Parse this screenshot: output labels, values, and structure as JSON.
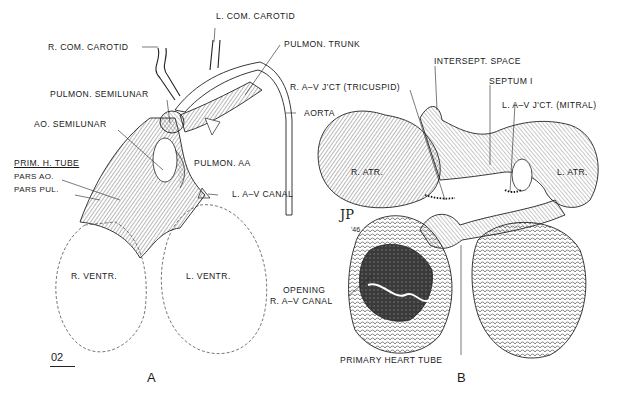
{
  "figure": {
    "panels": [
      {
        "id": "A",
        "letter": "A",
        "labels": {
          "r_com_carotid": "R. COM. CAROTID",
          "l_com_carotid": "L. COM. CAROTID",
          "pulmon_trunk": "PULMON. TRUNK",
          "pulmon_semilunar": "PULMON. SEMILUNAR",
          "ao_semilunar": "AO. SEMILUNAR",
          "prim_h_tube": "PRIM. H. TUBE",
          "pars_ao": "PARS AO.",
          "pars_pul": "PARS PUL.",
          "pulmon_aa": "PULMON. AA",
          "l_av_canal": "L. A–V CANAL",
          "aorta": "AORTA",
          "r_ventr": "R. VENTR.",
          "l_ventr": "L. VENTR."
        },
        "scale_label": "02"
      },
      {
        "id": "B",
        "letter": "B",
        "labels": {
          "r_av_jct": "R. A–V J'CT (TRICUSPID)",
          "intersept_space": "INTERSEPT. SPACE",
          "septum_i": "SEPTUM I",
          "l_av_jct": "L. A–V J'CT. (MITRAL)",
          "r_atr": "R. ATR.",
          "l_atr": "L. ATR.",
          "opening_line1": "OPENING",
          "opening_line2": "R. A–V CANAL",
          "primary_heart_tube": "PRIMARY HEART TUBE"
        },
        "signature": "JP",
        "signature_year": "'46"
      }
    ]
  }
}
